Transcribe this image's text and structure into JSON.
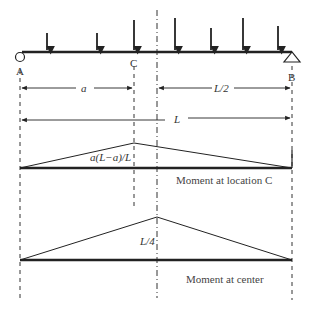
{
  "diagram": {
    "type": "influence-line-moment-diagram",
    "colors": {
      "line": "#222222",
      "text": "#333333",
      "background": "#ffffff"
    },
    "supports": {
      "A": {
        "label": "A",
        "type": "pin-circle"
      },
      "B": {
        "label": "B",
        "type": "roller-triangle"
      }
    },
    "point_C_label": "C",
    "loads": [
      {
        "x": 47,
        "top": 33
      },
      {
        "x": 97,
        "top": 33
      },
      {
        "x": 134,
        "top": 20
      },
      {
        "x": 175,
        "top": 18
      },
      {
        "x": 211,
        "top": 28
      },
      {
        "x": 243,
        "top": 18
      },
      {
        "x": 278,
        "top": 26
      }
    ],
    "dimensions": {
      "a_label": "a",
      "half_label": "L/2",
      "span_label": "L"
    },
    "moment_at_C": {
      "peak_label": "a(L−a)/L",
      "caption": "Moment at location C"
    },
    "moment_at_center": {
      "peak_label": "L/4",
      "caption": "Moment at center"
    }
  }
}
